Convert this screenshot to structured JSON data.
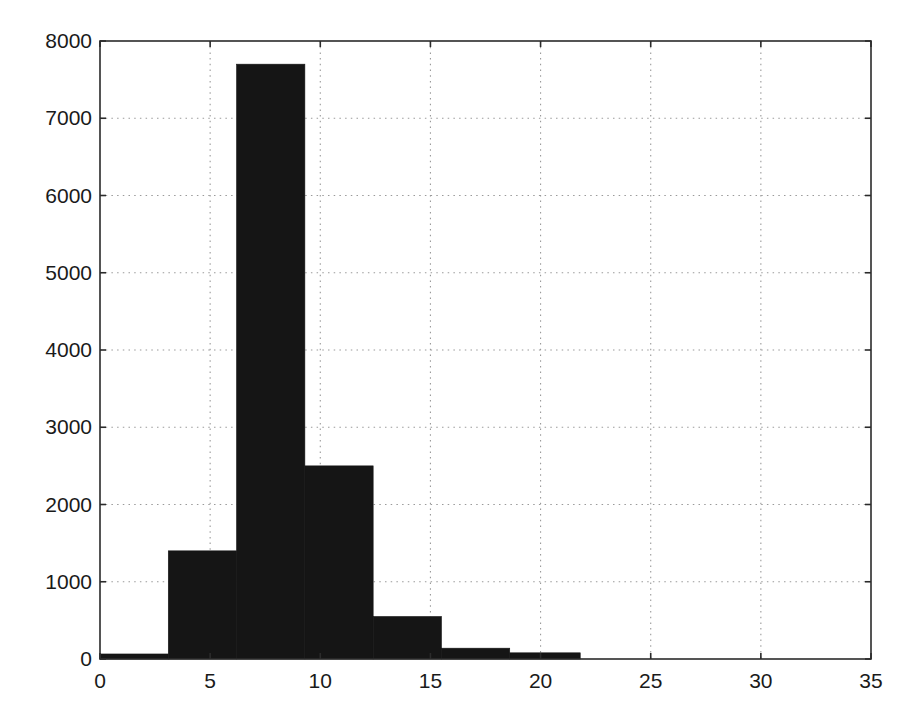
{
  "chart_data": {
    "type": "bar",
    "title": "",
    "subtitle": "",
    "xlabel": "",
    "ylabel": "",
    "xlim": [
      0,
      35
    ],
    "ylim": [
      0,
      8000
    ],
    "grid": true,
    "legend": null,
    "legend_position": "none",
    "bar_color": "#151515",
    "axis_color": "#2b2b2b",
    "grid_color": "#9a9a9a",
    "background_color": "#ffffff",
    "xticks": [
      0,
      5,
      10,
      15,
      20,
      25,
      30,
      35
    ],
    "xtick_labels": [
      "0",
      "5",
      "10",
      "15",
      "20",
      "25",
      "30",
      "35"
    ],
    "yticks": [
      0,
      1000,
      2000,
      3000,
      4000,
      5000,
      6000,
      7000,
      8000
    ],
    "ytick_labels": [
      "0",
      "1000",
      "2000",
      "3000",
      "4000",
      "5000",
      "6000",
      "7000",
      "8000"
    ],
    "bin_edges": [
      0,
      3.1,
      6.2,
      9.3,
      12.4,
      15.5,
      18.6,
      21.8
    ],
    "categories": [
      "0-3.1",
      "3.1-6.2",
      "6.2-9.3",
      "9.3-12.4",
      "12.4-15.5",
      "15.5-18.6",
      "18.6-21.8"
    ],
    "values": [
      65,
      1400,
      7700,
      2500,
      550,
      140,
      80
    ]
  },
  "chart": {
    "geometry": {
      "plot_left": 100,
      "plot_right": 871,
      "plot_top": 41,
      "plot_bottom": 659,
      "tick_len": 6,
      "xtick_label_y": 688,
      "ytick_label_x": 92,
      "ytick_label_dy": 7
    }
  }
}
